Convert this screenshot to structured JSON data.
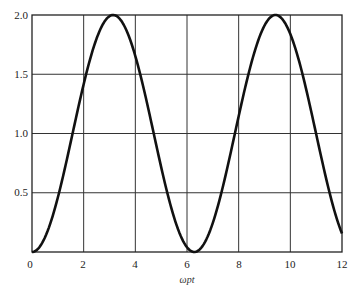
{
  "chart_data": {
    "type": "line",
    "title": "",
    "xlabel": "ωpt",
    "ylabel": "",
    "xlim": [
      0,
      12
    ],
    "ylim": [
      0,
      2.0
    ],
    "grid": true,
    "legend": null,
    "x_ticks": [
      0,
      2,
      4,
      6,
      8,
      10,
      12
    ],
    "x_tick_labels": [
      "0",
      "2",
      "4",
      "6",
      "8",
      "10",
      "12"
    ],
    "y_ticks": [
      0.5,
      1.0,
      1.5,
      2.0
    ],
    "y_tick_labels": [
      "0.5",
      "1.0",
      "1.5",
      "2.0"
    ],
    "series": [
      {
        "name": "curve",
        "function_form": "1 - cos(x)",
        "x": [
          0,
          0.5,
          1,
          1.5,
          2,
          2.5,
          3,
          3.1416,
          3.5,
          4,
          4.5,
          5,
          5.5,
          6,
          6.2832,
          6.5,
          7,
          7.5,
          8,
          8.5,
          9,
          9.4248,
          10,
          10.5,
          11,
          11.5,
          12
        ],
        "y": [
          0,
          0.12,
          0.46,
          0.93,
          1.42,
          1.8,
          1.99,
          2.0,
          1.94,
          1.65,
          1.21,
          0.72,
          0.29,
          0.04,
          0,
          0.02,
          0.25,
          0.65,
          1.15,
          1.6,
          1.91,
          2.0,
          1.84,
          1.48,
          1.0,
          0.5,
          0.16
        ]
      }
    ]
  },
  "labels": {
    "x_axis": "ωpt",
    "x_ticks": [
      "0",
      "2",
      "4",
      "6",
      "8",
      "10",
      "12"
    ],
    "y_ticks": [
      "0.5",
      "1.0",
      "1.5",
      "2.0"
    ]
  }
}
